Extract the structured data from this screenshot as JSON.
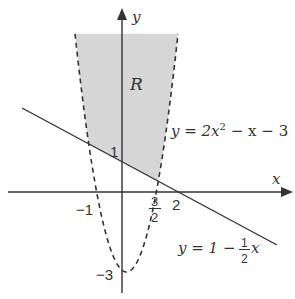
{
  "diagram": {
    "type": "function-graph",
    "axes": {
      "x_label": "x",
      "y_label": "y"
    },
    "region": {
      "label": "R",
      "fill_color": "#d6d6d6"
    },
    "curves": {
      "parabola": {
        "equation_prefix": "y = 2x",
        "equation_exp": "2",
        "equation_suffix": " − x − 3",
        "style": "dashed",
        "x_intercepts": [
          "-1",
          "3/2"
        ],
        "y_intercept": "-3"
      },
      "line": {
        "equation_prefix": "y = 1 − ",
        "fraction_num": "1",
        "fraction_den": "2",
        "equation_suffix": "x",
        "style": "solid",
        "x_intercept": "2",
        "y_intercept": "1"
      }
    },
    "tick_labels": {
      "neg_one": "−1",
      "three": "3",
      "two_den": "2",
      "two": "2",
      "one": "1",
      "neg_three": "−3"
    },
    "colors": {
      "stroke": "#333333",
      "shade": "#d6d6d6",
      "background": "#ffffff"
    }
  }
}
